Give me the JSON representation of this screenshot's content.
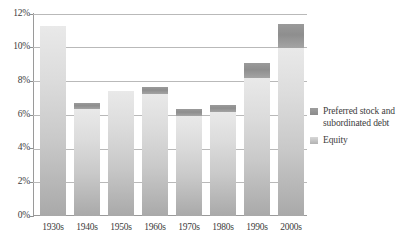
{
  "chart_data": {
    "type": "bar",
    "title": "",
    "subtitle": "",
    "xlabel": "",
    "ylabel": "",
    "stacked": true,
    "grid": true,
    "legend_position": "right",
    "ylim": [
      0,
      12
    ],
    "ytick_values": [
      0,
      2,
      4,
      6,
      8,
      10,
      12
    ],
    "ytick_labels": [
      "0%",
      "2%",
      "4%",
      "6%",
      "8%",
      "10%",
      "12%"
    ],
    "categories": [
      "1930s",
      "1940s",
      "1950s",
      "1960s",
      "1970s",
      "1980s",
      "1990s",
      "2000s"
    ],
    "series": [
      {
        "name": "Equity",
        "color": "#c9c9c9",
        "values": [
          11.3,
          6.35,
          7.4,
          7.25,
          5.95,
          6.2,
          8.2,
          10.0
        ]
      },
      {
        "name": "Preferred stock and subordinated debt",
        "color": "#909090",
        "values": [
          0.0,
          0.35,
          0.0,
          0.4,
          0.4,
          0.4,
          0.9,
          1.4
        ]
      }
    ],
    "totals": [
      11.3,
      6.7,
      7.4,
      7.65,
      6.35,
      6.6,
      9.1,
      11.4
    ]
  },
  "legend": {
    "entries": [
      {
        "label": "Preferred stock and subordinated debt",
        "swatch": "preferred-swatch"
      },
      {
        "label": "Equity",
        "swatch": "equity-swatch"
      }
    ]
  },
  "axis": {
    "y_labels": [
      "12%",
      "10%",
      "8%",
      "6%",
      "4%",
      "2%",
      "0%"
    ],
    "x_labels": [
      "1930s",
      "1940s",
      "1950s",
      "1960s",
      "1970s",
      "1980s",
      "1990s",
      "2000s"
    ]
  },
  "colors": {
    "equity": "#c9c9c9",
    "preferred": "#909090",
    "gridline": "#b9b9b9",
    "axis": "#9a9a9a",
    "text": "#3c3c3c",
    "background": "#ffffff"
  }
}
